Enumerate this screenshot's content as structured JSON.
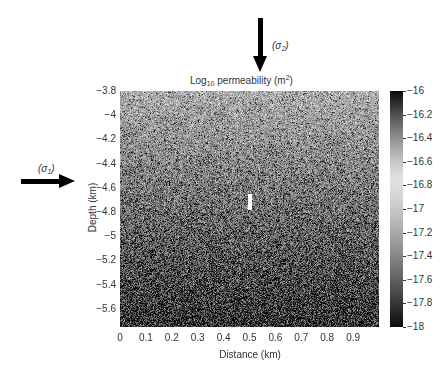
{
  "chart_data": {
    "type": "heatmap",
    "title": "Log10 permeability (m2)",
    "title_parts": {
      "base": "Log",
      "sub": "10",
      "mid": " permeability (m",
      "sup": "2",
      "end": ")"
    },
    "xlabel": "Distance (km)",
    "ylabel": "Depth (km)",
    "xlim": [
      0,
      1.0
    ],
    "ylim": [
      -5.75,
      -3.8
    ],
    "x_ticks": [
      "0",
      "0.1",
      "0.2",
      "0.3",
      "0.4",
      "0.5",
      "0.6",
      "0.7",
      "0.8",
      "0.9"
    ],
    "x_tick_values": [
      0,
      0.1,
      0.2,
      0.3,
      0.4,
      0.5,
      0.6,
      0.7,
      0.8,
      0.9
    ],
    "y_ticks": [
      "−3.8",
      "−4",
      "−4.2",
      "−4.4",
      "−4.6",
      "−4.8",
      "−5",
      "−5.2",
      "−5.4",
      "−5.6"
    ],
    "y_tick_values": [
      -3.8,
      -4.0,
      -4.2,
      -4.4,
      -4.6,
      -4.8,
      -5.0,
      -5.2,
      -5.4,
      -5.6
    ],
    "colorbar": {
      "ticks": [
        "−16",
        "−16.2",
        "−16.4",
        "−16.6",
        "−16.8",
        "−17",
        "−17.2",
        "−17.4",
        "−17.6",
        "−17.8",
        "−18"
      ],
      "tick_values": [
        -16,
        -16.2,
        -16.4,
        -16.6,
        -16.8,
        -17,
        -17.2,
        -17.4,
        -17.6,
        -17.8,
        -18
      ],
      "range": [
        -18,
        -16
      ],
      "colormap": "gray, dark at both ends, lightest near -16.7"
    },
    "feature": {
      "x_km": 0.5,
      "depth_km": -4.72,
      "shape": "vertical white bar"
    },
    "annotations": [
      {
        "text": "(σ2)",
        "type": "arrow-down",
        "x_km": 0.53
      },
      {
        "text": "(σ1)",
        "type": "arrow-right",
        "depth_km": -4.78
      }
    ],
    "grid": false
  },
  "annotations": {
    "sigma2": {
      "open": "(",
      "sym": "σ",
      "sub": "2",
      "close": ")"
    },
    "sigma1": {
      "open": "(",
      "sym": "σ",
      "sub": "1",
      "close": ")"
    }
  }
}
